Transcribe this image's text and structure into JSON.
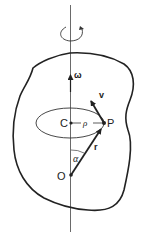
{
  "diagram": {
    "type": "rigid-body-rotation",
    "labels": {
      "omega": "ω",
      "velocity": "v",
      "point_p": "P",
      "center_c": "C",
      "rho": "ρ",
      "origin_o": "O",
      "position_r": "r",
      "angle_alpha": "α"
    },
    "colors": {
      "ink": "#222222",
      "background": "#ffffff"
    }
  }
}
